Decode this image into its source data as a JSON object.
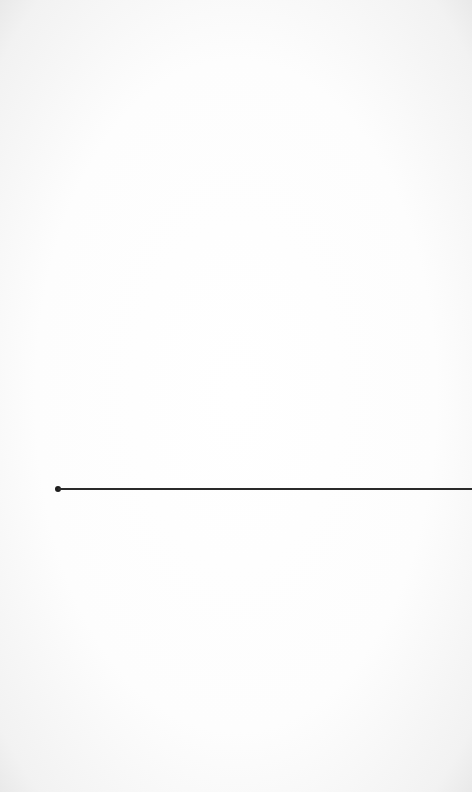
{
  "page": {
    "background_color": "#fdfdfd",
    "vignette_color": "#e9e9e9"
  },
  "line": {
    "color": "#2a2a2a",
    "x_start": 58,
    "x_end": 472,
    "y": 489,
    "endpoint_marker": "dot"
  }
}
